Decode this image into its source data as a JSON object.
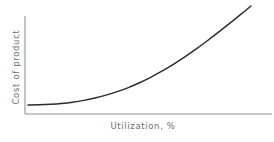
{
  "chart_data": {
    "type": "line",
    "title": "",
    "subtitle": "",
    "xlabel": "Utilization, %",
    "ylabel": "Cost of product",
    "xlim": [
      0,
      100
    ],
    "ylim": [
      0,
      100
    ],
    "grid": false,
    "legend": null,
    "xticks": [],
    "yticks": [],
    "xticklabels": [],
    "yticklabels": [],
    "annotations": [],
    "series": [
      {
        "name": "Cost of product vs. utilization",
        "shape": "convex increasing (exponential-like)",
        "x": [
          0,
          5,
          10,
          15,
          20,
          25,
          30,
          35,
          40,
          45,
          50,
          55,
          60,
          65,
          70,
          75,
          80,
          85,
          90,
          95,
          100
        ],
        "y": [
          1.5,
          1.7,
          2.2,
          3.1,
          4.5,
          6.4,
          8.9,
          12.0,
          15.7,
          20.1,
          25.2,
          31.0,
          37.5,
          44.6,
          52.3,
          60.5,
          69.2,
          78.3,
          87.7,
          97.3,
          107.0
        ]
      }
    ],
    "colors": {
      "curve": "#2b2b2b",
      "axis": "#b4b4b4",
      "label": "#6e6e6e",
      "background": "#ffffff"
    },
    "geometry": {
      "y_axis_x": 25,
      "y_axis_top": 16,
      "y_axis_bottom": 114,
      "x_axis_y": 114,
      "x_axis_left": 25,
      "x_axis_right": 272,
      "curve_start": [
        28,
        105
      ],
      "curve_end": [
        251,
        6
      ]
    }
  },
  "labels": {
    "y_axis": "Cost of product",
    "x_axis": "Utilization, %"
  }
}
